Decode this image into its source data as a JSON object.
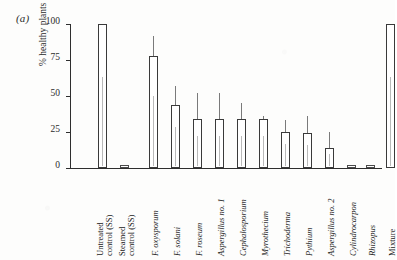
{
  "figure": {
    "panel_label": "(a)"
  },
  "chart_data": {
    "type": "bar",
    "title": "",
    "subtitle": "",
    "xlabel": "",
    "ylabel": "% healthy plants",
    "ylim": [
      0,
      100
    ],
    "yticks": [
      0,
      25,
      50,
      75,
      100
    ],
    "ytick_labels": [
      "0",
      "25",
      "50",
      "75",
      "100"
    ],
    "grid": false,
    "legend": null,
    "error_bars": "upper whisker only",
    "categories": [
      "Untreated control (SS)",
      "Steamed control (SS)",
      "F. oxysporum",
      "F. solani",
      "F. roseum",
      "Aspergillus no. 1",
      "Cephalosporium",
      "Myrothecium",
      "Trichoderma",
      "Pythium",
      "Aspergillus no. 2",
      "Cylindrocarpon",
      "Rhizopus",
      "Mixture"
    ],
    "category_lines": [
      [
        "Untreated",
        "control (SS)"
      ],
      [
        "Steamed",
        "control (SS)"
      ],
      [
        "F. oxysporum"
      ],
      [
        "F. solani"
      ],
      [
        "F. roseum"
      ],
      [
        "Aspergillus no. 1"
      ],
      [
        "Cephalosporium"
      ],
      [
        "Myrothecium"
      ],
      [
        "Trichoderma"
      ],
      [
        "Pythium"
      ],
      [
        "Aspergillus no. 2"
      ],
      [
        "Cylindrocarpon"
      ],
      [
        "Rhizopus"
      ],
      [
        "Mixture"
      ]
    ],
    "category_italic": [
      false,
      false,
      true,
      true,
      true,
      true,
      true,
      true,
      true,
      true,
      true,
      true,
      true,
      false
    ],
    "values": [
      100,
      2,
      78,
      44,
      34,
      34,
      34,
      34,
      25,
      24,
      14,
      2,
      2,
      100
    ],
    "error_upper": [
      100,
      2,
      92,
      57,
      52,
      52,
      45,
      36,
      33,
      36,
      25,
      2,
      2,
      100
    ],
    "bar_x": [
      28,
      50,
      79,
      101,
      123,
      145,
      167,
      189,
      211,
      233,
      255,
      277,
      296,
      316
    ]
  },
  "colors": {
    "bar_fill": "#ffffff",
    "bar_stroke": "#3a3a3a",
    "axis": "#2e2e2e",
    "whisker": "#7a7a7a",
    "text": "#222222",
    "background": "#fdfdfc"
  }
}
